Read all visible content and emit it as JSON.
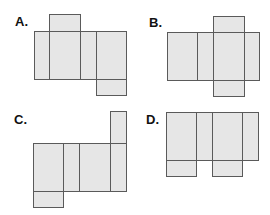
{
  "style": {
    "fill": "#e6e6e6",
    "stroke": "#5a5a5a"
  },
  "figures": [
    {
      "label": "A.",
      "label_pos": [
        15,
        15
      ],
      "faces": [
        {
          "x": 49,
          "y": 14,
          "w": 31,
          "h": 17
        },
        {
          "x": 34,
          "y": 31,
          "w": 15,
          "h": 48
        },
        {
          "x": 49,
          "y": 31,
          "w": 31,
          "h": 48
        },
        {
          "x": 80,
          "y": 31,
          "w": 16,
          "h": 48
        },
        {
          "x": 96,
          "y": 31,
          "w": 30,
          "h": 48
        },
        {
          "x": 96,
          "y": 79,
          "w": 30,
          "h": 16
        }
      ]
    },
    {
      "label": "B.",
      "label_pos": [
        149,
        16
      ],
      "faces": [
        {
          "x": 213,
          "y": 16,
          "w": 31,
          "h": 16
        },
        {
          "x": 167,
          "y": 32,
          "w": 30,
          "h": 48
        },
        {
          "x": 197,
          "y": 32,
          "w": 16,
          "h": 48
        },
        {
          "x": 213,
          "y": 32,
          "w": 31,
          "h": 48
        },
        {
          "x": 244,
          "y": 32,
          "w": 15,
          "h": 48
        },
        {
          "x": 213,
          "y": 80,
          "w": 31,
          "h": 16
        }
      ]
    },
    {
      "label": "C.",
      "label_pos": [
        14,
        113
      ],
      "faces": [
        {
          "x": 110,
          "y": 111,
          "w": 16,
          "h": 32
        },
        {
          "x": 33,
          "y": 143,
          "w": 30,
          "h": 48
        },
        {
          "x": 63,
          "y": 143,
          "w": 16,
          "h": 48
        },
        {
          "x": 79,
          "y": 143,
          "w": 31,
          "h": 48
        },
        {
          "x": 110,
          "y": 143,
          "w": 16,
          "h": 48
        },
        {
          "x": 33,
          "y": 191,
          "w": 30,
          "h": 16
        }
      ]
    },
    {
      "label": "D.",
      "label_pos": [
        146,
        113
      ],
      "faces": [
        {
          "x": 166,
          "y": 112,
          "w": 30,
          "h": 48
        },
        {
          "x": 196,
          "y": 112,
          "w": 16,
          "h": 48
        },
        {
          "x": 212,
          "y": 112,
          "w": 30,
          "h": 48
        },
        {
          "x": 242,
          "y": 112,
          "w": 16,
          "h": 48
        },
        {
          "x": 166,
          "y": 160,
          "w": 30,
          "h": 16
        },
        {
          "x": 212,
          "y": 160,
          "w": 30,
          "h": 16
        }
      ]
    }
  ]
}
